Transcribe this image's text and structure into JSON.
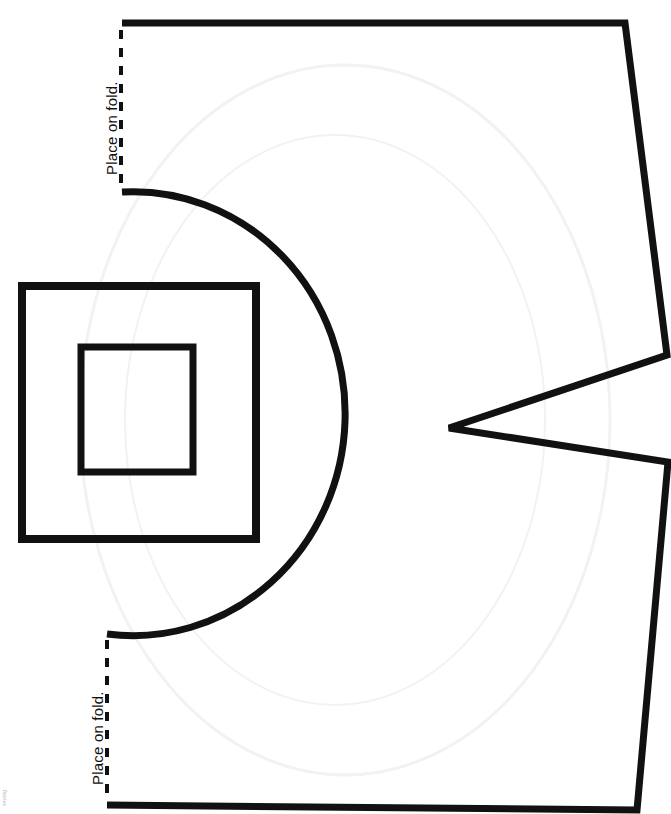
{
  "sheet": {
    "width": 671,
    "height": 814,
    "background_color": "#ffffff",
    "ink_color": "#111111",
    "watermark_color": "#f2f2f0",
    "title": "Sewing Pattern Template"
  },
  "labels": {
    "fold_top": "Place on fold.",
    "fold_bottom": "Place on fold.",
    "corner_credit": "sewing"
  },
  "geometry": {
    "stroke_width_main": 7,
    "stroke_width_square_outer": 8,
    "stroke_width_square_inner": 7,
    "stroke_width_arc": 7,
    "dash_pattern": "9 9",
    "fold_line_top": {
      "x": 121,
      "y1": 30,
      "y2": 190
    },
    "fold_line_bottom": {
      "x": 107,
      "y1": 640,
      "y2": 800
    },
    "outline_points": "122,23 625,23 667,355 449,428 668,462 637,810 107,805",
    "arc_start": {
      "x": 122,
      "y": 192
    },
    "arc_end": {
      "x": 107,
      "y": 634
    },
    "arc_rx": 212,
    "arc_ry": 222,
    "square_outer": {
      "x": 22,
      "y": 286,
      "width": 234,
      "height": 253
    },
    "square_inner": {
      "x": 81,
      "y": 347,
      "width": 112,
      "height": 125
    },
    "watermark_ellipse": {
      "cx": 345,
      "cy": 420,
      "rx": 265,
      "ry": 355
    }
  },
  "shapes": [
    {
      "name": "main-outline",
      "kind": "polyline-open"
    },
    {
      "name": "fold-edge-arc",
      "kind": "arc"
    },
    {
      "name": "fold-line-top",
      "kind": "dashed-line"
    },
    {
      "name": "fold-line-bottom",
      "kind": "dashed-line"
    },
    {
      "name": "outer-square",
      "kind": "rect"
    },
    {
      "name": "inner-square",
      "kind": "rect"
    },
    {
      "name": "bleed-through-watermark",
      "kind": "ellipse"
    }
  ]
}
